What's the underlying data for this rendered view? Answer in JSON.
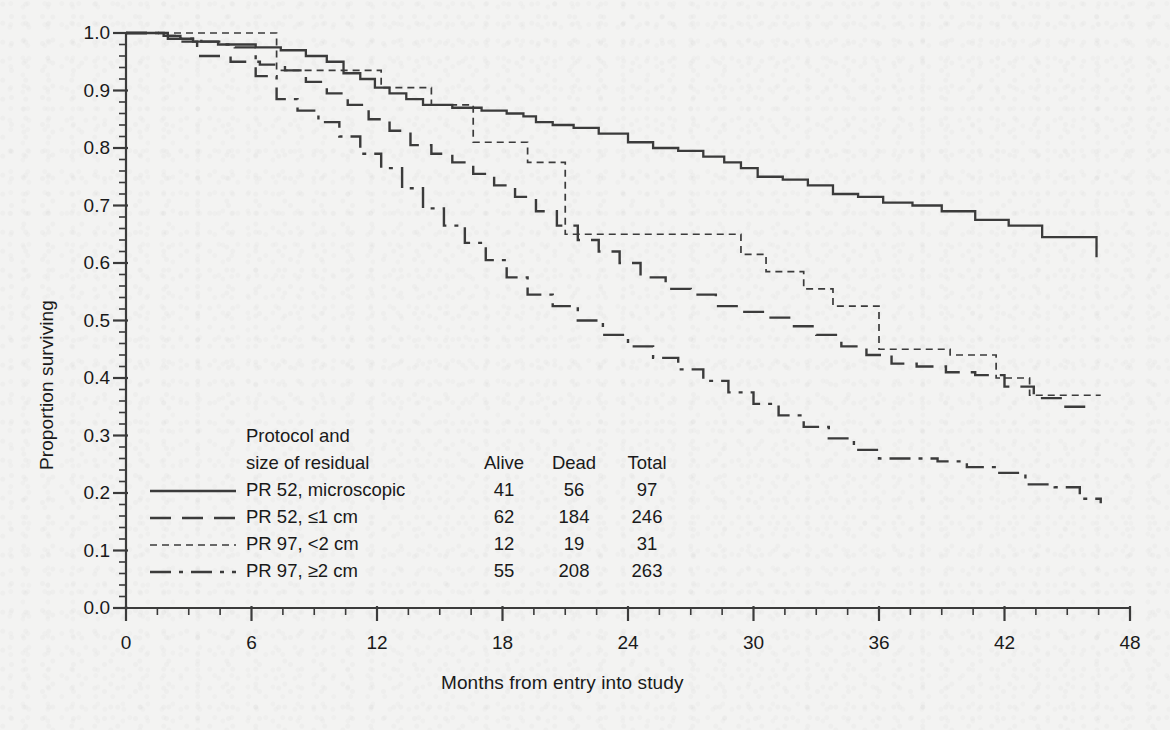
{
  "chart_data": {
    "type": "line",
    "title": "",
    "subtitle": "",
    "xlabel": "Months from entry into study",
    "ylabel": "Proportion surviving",
    "xlim": [
      0,
      48
    ],
    "ylim": [
      0.0,
      1.0
    ],
    "xticks": [
      0,
      6,
      12,
      18,
      24,
      30,
      36,
      42,
      48
    ],
    "xtick_labels": [
      "0",
      "6",
      "12",
      "18",
      "24",
      "30",
      "36",
      "42",
      "48"
    ],
    "x_minor_tick_interval": 1.5,
    "yticks": [
      0.0,
      0.1,
      0.2,
      0.3,
      0.4,
      0.5,
      0.6,
      0.7,
      0.8,
      0.9,
      1.0
    ],
    "ytick_labels": [
      "0.0",
      "0.1",
      "0.2",
      "0.3",
      "0.4",
      "0.5",
      "0.6",
      "0.7",
      "0.8",
      "0.9",
      "1.0"
    ],
    "y_minor_tick_interval": 0.02,
    "grid": false,
    "legend_position": "inside-lower-left",
    "step_curves": true,
    "line_color": "#3b3b3b",
    "series": [
      {
        "name": "PR 52, microscopic",
        "dash": "solid",
        "alive": 41,
        "dead": 56,
        "total": 97,
        "x": [
          0,
          1.2,
          2.0,
          3.2,
          4.4,
          6.2,
          7.4,
          8.6,
          9.6,
          10.4,
          11.2,
          11.9,
          12.6,
          13.4,
          14.2,
          15.6,
          17.0,
          18.2,
          19.0,
          19.6,
          20.4,
          21.4,
          22.6,
          24.0,
          25.2,
          26.4,
          27.6,
          28.6,
          29.4,
          30.2,
          31.4,
          32.6,
          33.8,
          35.0,
          36.2,
          37.6,
          39.0,
          40.6,
          42.2,
          43.8,
          45.4,
          46.4
        ],
        "y": [
          1.0,
          1.0,
          0.99,
          0.985,
          0.98,
          0.975,
          0.97,
          0.96,
          0.95,
          0.93,
          0.92,
          0.905,
          0.895,
          0.885,
          0.875,
          0.87,
          0.865,
          0.86,
          0.855,
          0.845,
          0.84,
          0.835,
          0.825,
          0.81,
          0.8,
          0.795,
          0.785,
          0.775,
          0.765,
          0.75,
          0.745,
          0.735,
          0.72,
          0.715,
          0.705,
          0.7,
          0.69,
          0.675,
          0.665,
          0.645,
          0.645,
          0.61
        ]
      },
      {
        "name": "PR 52, ≤1 cm",
        "dash": "long-dash",
        "alive": 62,
        "dead": 184,
        "total": 246,
        "x": [
          0,
          1.8,
          2.4,
          3.4,
          5.0,
          6.4,
          7.6,
          8.6,
          9.6,
          10.6,
          11.6,
          12.6,
          13.6,
          14.6,
          15.6,
          16.6,
          17.6,
          18.6,
          19.6,
          20.6,
          21.6,
          22.6,
          23.6,
          24.6,
          25.8,
          27.0,
          28.2,
          29.4,
          30.6,
          31.8,
          33.0,
          34.2,
          35.4,
          36.6,
          37.8,
          39.2,
          40.6,
          42.0,
          43.4,
          44.8,
          46.2
        ],
        "y": [
          1.0,
          0.995,
          0.985,
          0.96,
          0.95,
          0.945,
          0.935,
          0.915,
          0.895,
          0.875,
          0.85,
          0.83,
          0.805,
          0.79,
          0.775,
          0.755,
          0.735,
          0.715,
          0.69,
          0.665,
          0.64,
          0.62,
          0.6,
          0.575,
          0.555,
          0.545,
          0.525,
          0.515,
          0.505,
          0.49,
          0.475,
          0.455,
          0.44,
          0.425,
          0.42,
          0.41,
          0.405,
          0.385,
          0.365,
          0.35,
          0.345
        ]
      },
      {
        "name": "PR 97, <2 cm",
        "dash": "fine-dot",
        "alive": 12,
        "dead": 19,
        "total": 31,
        "x": [
          0,
          7.2,
          7.2,
          12.2,
          12.2,
          14.6,
          14.6,
          16.6,
          16.6,
          19.2,
          19.2,
          21.0,
          21.0,
          29.4,
          29.4,
          30.6,
          30.6,
          32.4,
          32.4,
          33.8,
          33.8,
          36.0,
          36.0,
          39.4,
          39.4,
          41.6,
          41.6,
          43.2,
          43.2,
          46.6
        ],
        "y": [
          1.0,
          1.0,
          0.935,
          0.935,
          0.905,
          0.905,
          0.875,
          0.875,
          0.81,
          0.81,
          0.775,
          0.775,
          0.65,
          0.65,
          0.615,
          0.615,
          0.585,
          0.585,
          0.555,
          0.555,
          0.525,
          0.525,
          0.45,
          0.45,
          0.44,
          0.44,
          0.4,
          0.4,
          0.37,
          0.37
        ]
      },
      {
        "name": "PR 97, ≥2 cm",
        "dash": "dash-dot",
        "alive": 55,
        "dead": 208,
        "total": 263,
        "x": [
          0,
          1.6,
          2.6,
          3.6,
          4.6,
          5.2,
          6.2,
          7.2,
          8.2,
          9.2,
          10.2,
          11.2,
          12.2,
          13.2,
          14.2,
          15.2,
          16.2,
          17.2,
          18.2,
          19.2,
          20.4,
          21.6,
          22.8,
          24.0,
          25.2,
          26.4,
          27.6,
          28.8,
          30.0,
          31.2,
          32.4,
          33.6,
          34.8,
          36.0,
          37.4,
          38.8,
          40.2,
          41.6,
          43.0,
          44.4,
          45.6,
          46.6
        ],
        "y": [
          1.0,
          0.995,
          0.99,
          0.985,
          0.98,
          0.975,
          0.925,
          0.885,
          0.865,
          0.845,
          0.82,
          0.79,
          0.765,
          0.73,
          0.695,
          0.665,
          0.635,
          0.605,
          0.575,
          0.545,
          0.525,
          0.5,
          0.475,
          0.455,
          0.435,
          0.415,
          0.395,
          0.375,
          0.355,
          0.335,
          0.315,
          0.295,
          0.275,
          0.26,
          0.26,
          0.255,
          0.245,
          0.235,
          0.215,
          0.21,
          0.19,
          0.182
        ]
      }
    ]
  },
  "legend": {
    "header_line1": "Protocol and",
    "header_line2": "size of residual",
    "col_alive": "Alive",
    "col_dead": "Dead",
    "col_total": "Total",
    "rows": [
      {
        "name": "PR 52, microscopic",
        "alive": "41",
        "dead": "56",
        "total": "97"
      },
      {
        "name": "PR 52, ≤1 cm",
        "alive": "62",
        "dead": "184",
        "total": "246"
      },
      {
        "name": "PR 97, <2 cm",
        "alive": "12",
        "dead": "19",
        "total": "31"
      },
      {
        "name": "PR 97, ≥2 cm",
        "alive": "55",
        "dead": "208",
        "total": "263"
      }
    ]
  },
  "axes": {
    "ylabel": "Proportion surviving",
    "xlabel": "Months from entry into study",
    "ytick_labels": [
      "1.0",
      "0.9",
      "0.8",
      "0.7",
      "0.6",
      "0.5",
      "0.4",
      "0.3",
      "0.2",
      "0.1",
      "0.0"
    ],
    "xtick_labels": [
      "0",
      "6",
      "12",
      "18",
      "24",
      "30",
      "36",
      "42",
      "48"
    ]
  },
  "colors": {
    "background": "#f3f3f2",
    "ink": "#3b3b3b",
    "text": "#1a1a1a"
  }
}
